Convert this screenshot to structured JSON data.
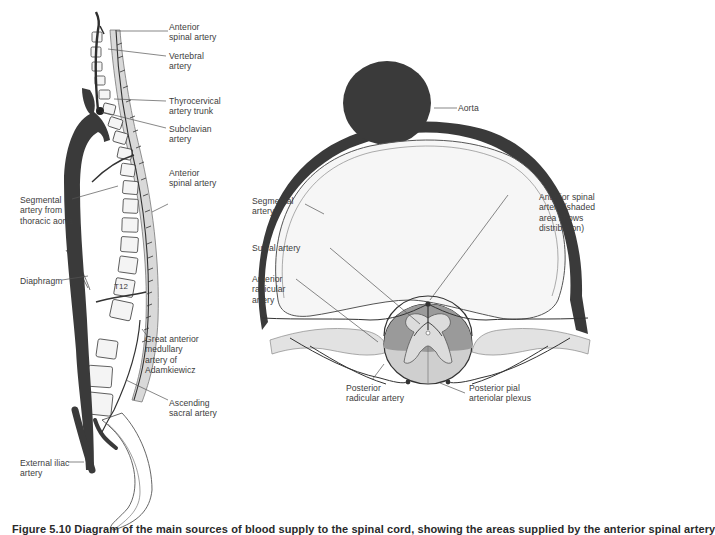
{
  "figure": {
    "caption": "Figure 5.10 Diagram of the main sources of blood supply to the spinal cord, showing the areas supplied by the anterior spinal artery",
    "colors": {
      "artery": "#3a3a3a",
      "spinal_canal_shade": "#d9d9d9",
      "cord_anterior_shade": "#9a9a9a",
      "cord_posterior_shade": "#cfcfcf",
      "vertebral_body_fill": "#f4f4f4",
      "line": "#555555"
    }
  },
  "left_panel": {
    "title": "Sagittal view of spinal arterial supply",
    "labels": {
      "anterior_spinal_artery_top": "Anterior\nspinal artery",
      "vertebral_artery": "Vertebral\nartery",
      "thyrocervical_trunk": "Thyrocervical\nartery trunk",
      "subclavian_artery": "Subclavian\nartery",
      "anterior_spinal_artery_mid": "Anterior\nspinal artery",
      "segmental_artery": "Segmental\nartery from\nthoracic aorta",
      "diaphragm": "Diaphragm",
      "t12": "T12",
      "great_anterior_medullary": "Great anterior\nmedullary\nartery of\nAdamkiewicz",
      "ascending_sacral": "Ascending\nsacral artery",
      "external_iliac": "External iliac\nartery"
    }
  },
  "right_panel": {
    "title": "Axial cross-section of arterial supply",
    "labels": {
      "aorta": "Aorta",
      "segmental_artery": "Segmental\nartery",
      "anterior_spinal_artery": "Anterior spinal\nartery (shaded\narea shows\ndistribution)",
      "sulcal_artery": "Sulcal artery",
      "anterior_radicular": "Anterior\nradicular\nartery",
      "posterior_radicular": "Posterior\nradicular artery",
      "posterior_pial_plexus": "Posterior pial\narteriolar plexus"
    }
  }
}
